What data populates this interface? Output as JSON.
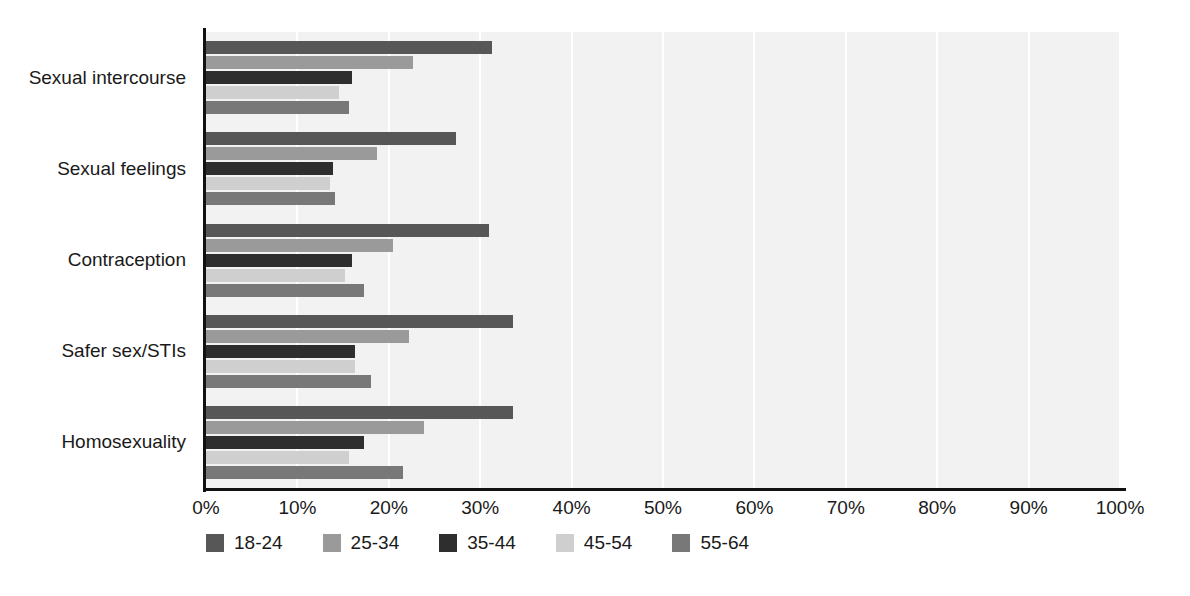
{
  "chart_data": {
    "type": "bar",
    "orientation": "horizontal",
    "title": "",
    "subtitle": "",
    "xlabel": "",
    "ylabel": "",
    "xlim": [
      0,
      100
    ],
    "x_tick_labels": [
      "0%",
      "10%",
      "20%",
      "30%",
      "40%",
      "50%",
      "60%",
      "70%",
      "80%",
      "90%",
      "100%"
    ],
    "x_tick_values": [
      0,
      10,
      20,
      30,
      40,
      50,
      60,
      70,
      80,
      90,
      100
    ],
    "grid": "vertical-white-gridlines",
    "legend_position": "bottom-left",
    "value_unit": "%",
    "categories": [
      "Sexual intercourse",
      "Sexual feelings",
      "Contraception",
      "Safer sex/STIs",
      "Homosexuality"
    ],
    "series": [
      {
        "name": "18-24",
        "color": "#575757",
        "values": [
          31.3,
          27.3,
          31.0,
          33.6,
          33.6
        ]
      },
      {
        "name": "25-34",
        "color": "#9a9a9a",
        "values": [
          22.7,
          18.7,
          20.5,
          22.2,
          23.8
        ]
      },
      {
        "name": "35-44",
        "color": "#2e2e2e",
        "values": [
          16.0,
          13.9,
          16.0,
          16.3,
          17.3
        ]
      },
      {
        "name": "45-54",
        "color": "#cfcfcf",
        "values": [
          14.5,
          13.6,
          15.2,
          16.3,
          15.6
        ]
      },
      {
        "name": "55-64",
        "color": "#787878",
        "values": [
          15.7,
          14.1,
          17.3,
          18.1,
          21.6
        ]
      }
    ]
  },
  "plot_style": {
    "plot_background": "#f2f2f2",
    "gridline_color": "#ffffff",
    "axis_color": "#111111",
    "page_background": "#ffffff"
  }
}
